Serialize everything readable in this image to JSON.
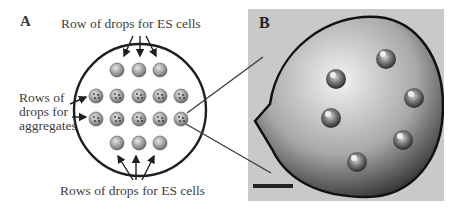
{
  "panel_a": {
    "letter": "A",
    "label_top": "Row of drops for ES cells",
    "label_left_lines": [
      "Rows of",
      "drops for",
      "aggregates"
    ],
    "label_bottom": "Rows of drops for ES cells",
    "dish": {
      "cx": 140,
      "cy": 110,
      "r": 66
    },
    "drop_radius": 7,
    "rows": [
      {
        "type": "es",
        "y": 70,
        "x": [
          117,
          139,
          160
        ]
      },
      {
        "type": "aggregate",
        "y": 96,
        "x": [
          96,
          117,
          139,
          160,
          181
        ]
      },
      {
        "type": "aggregate",
        "y": 119,
        "x": [
          96,
          117,
          139,
          160,
          181
        ]
      },
      {
        "type": "es",
        "y": 143,
        "x": [
          117,
          139,
          160
        ]
      }
    ]
  },
  "panel_b": {
    "letter": "B",
    "description": "Micrograph of a hanging drop containing aggregates",
    "scale_bar": true
  },
  "colors": {
    "line": "#1f1f1f",
    "drop_light": "#d8d8d8",
    "drop_dark": "#6a6a6a",
    "photo_bg": "#c9c9c9"
  }
}
